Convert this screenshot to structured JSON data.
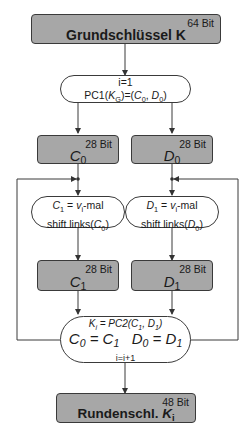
{
  "diagram": {
    "nodes": {
      "master_key": {
        "bits": "64 Bit",
        "label": "Grundschlüssel K"
      },
      "init": {
        "line1": "i=1",
        "line2_pre": "PC1(",
        "line2_k": "K",
        "line2_ksub": "G",
        "line2_mid": ")=(",
        "line2_c": "C",
        "line2_csub": "0",
        "line2_sep": ", ",
        "line2_d": "D",
        "line2_dsub": "0",
        "line2_post": ")"
      },
      "c0": {
        "bits": "28 Bit",
        "var": "C",
        "sub": "0"
      },
      "d0": {
        "bits": "28 Bit",
        "var": "D",
        "sub": "0"
      },
      "shift_c": {
        "l1_var": "C",
        "l1_sub": "1",
        "l1_eq": " = ",
        "l1_v": "v",
        "l1_vsub": "i",
        "l1_post": "-mal",
        "l2_pre": "shift links(",
        "l2_var": "C",
        "l2_sub": "0",
        "l2_post": ")"
      },
      "shift_d": {
        "l1_var": "D",
        "l1_sub": "1",
        "l1_eq": " = ",
        "l1_v": "v",
        "l1_vsub": "i",
        "l1_post": "-mal",
        "l2_pre": "shift links(",
        "l2_var": "D",
        "l2_sub": "0",
        "l2_post": ")"
      },
      "c1": {
        "bits": "28 Bit",
        "var": "C",
        "sub": "1"
      },
      "d1": {
        "bits": "28 Bit",
        "var": "D",
        "sub": "1"
      },
      "update": {
        "l1_k": "K",
        "l1_ksub": "i",
        "l1_rest": " = PC2(C",
        "l1_c1sub": "1",
        "l1_comma": ", D",
        "l1_d1sub": "1",
        "l1_close": ")",
        "l2_c0": "C",
        "l2_c0sub": "0",
        "l2_eq1": " = C",
        "l2_c1sub": "1",
        "l2_gap": "   D",
        "l2_d0sub": "0",
        "l2_eq2": " = D",
        "l2_d1sub": "1",
        "l3": "i=i+1"
      },
      "round_key": {
        "bits": "48 Bit",
        "label": "Rundenschl. ",
        "var": "K",
        "sub": "i"
      }
    },
    "colors": {
      "box_fill": "#a7a7a7",
      "stroke": "#3a3a3a",
      "pill_fill": "#ffffff"
    }
  }
}
